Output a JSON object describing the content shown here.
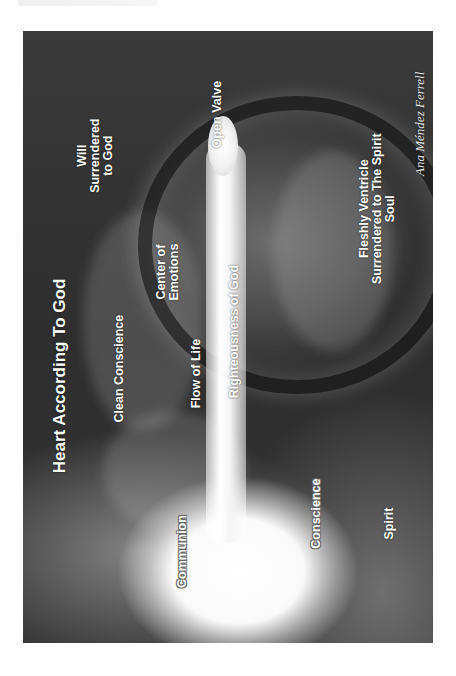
{
  "header": {
    "text": ""
  },
  "artwork": {
    "title": "Heart According To God",
    "labels": {
      "will": [
        "Will",
        "Surrendered",
        "to God"
      ],
      "open_valve": "Open Valve",
      "center_emotions": [
        "Center of",
        "Emotions"
      ],
      "clean_conscience": "Clean Conscience",
      "flow_of_life": "Flow of Life",
      "righteousness": "Righteousness of God",
      "fleshly_ventricle": [
        "Fleshly Ventricle",
        "Surrendered to The Spirit",
        "Soul"
      ],
      "communion": "Communion",
      "conscience": "Conscience",
      "spirit": "Spirit"
    },
    "signature": "Ana Méndez Ferrell",
    "colors": {
      "background": "#ffffff",
      "art_dark": "#333333",
      "label": "#ffffff"
    }
  }
}
